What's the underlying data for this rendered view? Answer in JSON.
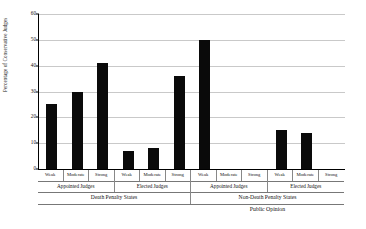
{
  "chart_data": {
    "type": "bar",
    "title": "",
    "xlabel": "Public Opinion",
    "ylabel": "Percentage of Conservative Judges",
    "ylim": [
      0,
      60
    ],
    "yticks": [
      0,
      10,
      20,
      30,
      40,
      50,
      60
    ],
    "grid": true,
    "legend": "none",
    "categories": [
      "Weak",
      "Moderate",
      "Strong",
      "Weak",
      "Moderate",
      "Strong",
      "Weak",
      "Moderate",
      "Strong",
      "Weak",
      "Moderate",
      "Strong"
    ],
    "values": [
      25,
      30,
      41,
      7,
      8,
      36,
      50,
      0,
      0,
      15,
      14,
      0
    ],
    "group_level_2": [
      {
        "label": "Appointed Judges",
        "span": 3
      },
      {
        "label": "Elected Judges",
        "span": 3
      },
      {
        "label": "Appointed Judges",
        "span": 3
      },
      {
        "label": "Elected Judges",
        "span": 3
      }
    ],
    "group_level_3": [
      {
        "label": "Death Penalty States",
        "span": 6
      },
      {
        "label": "Non-Death Penalty States",
        "span": 6
      }
    ],
    "group_level_4": [
      {
        "label": "",
        "span": 6
      },
      {
        "label": "Public Opinion",
        "span": 6
      }
    ]
  }
}
